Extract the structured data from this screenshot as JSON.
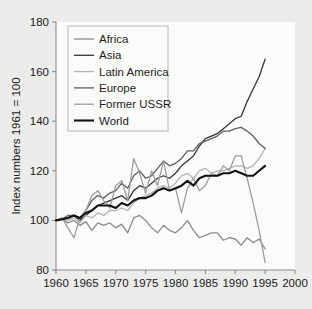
{
  "figure": {
    "background_color": "#ececeb",
    "plot_background_color": "#fbfbfa",
    "frame_color": "#8d8d8d"
  },
  "axes": {
    "y_title": "Index numbers 1961 = 100",
    "y_ticks": [
      "80",
      "100",
      "120",
      "140",
      "160",
      "180"
    ],
    "x_ticks": [
      "1960",
      "1965",
      "1970",
      "1975",
      "1980",
      "1985",
      "1990",
      "1995",
      "2000"
    ]
  },
  "legend": {
    "entries": [
      {
        "label": "Africa",
        "color": "#8c8c8c",
        "width": 1.3
      },
      {
        "label": "Asia",
        "color": "#353535",
        "width": 1.3
      },
      {
        "label": "Latin America",
        "color": "#b4b4b4",
        "width": 1.3
      },
      {
        "label": "Europe",
        "color": "#5f5f5f",
        "width": 1.3
      },
      {
        "label": "Former USSR",
        "color": "#9d9d9d",
        "width": 1.3
      },
      {
        "label": "World",
        "color": "#111111",
        "width": 2.1
      }
    ]
  },
  "chart_data": {
    "type": "line",
    "title": "",
    "xlabel": "",
    "ylabel": "Index numbers 1961 = 100",
    "xlim": [
      1960,
      2000
    ],
    "ylim": [
      80,
      180
    ],
    "xticks": [
      1960,
      1965,
      1970,
      1975,
      1980,
      1985,
      1990,
      1995,
      2000
    ],
    "yticks": [
      80,
      100,
      120,
      140,
      160,
      180
    ],
    "grid": false,
    "legend_position": "upper-left-inside",
    "x": [
      1960,
      1961,
      1962,
      1963,
      1964,
      1965,
      1966,
      1967,
      1968,
      1969,
      1970,
      1971,
      1972,
      1973,
      1974,
      1975,
      1976,
      1977,
      1978,
      1979,
      1980,
      1981,
      1982,
      1983,
      1984,
      1985,
      1986,
      1987,
      1988,
      1989,
      1990,
      1991,
      1992,
      1993,
      1994,
      1995
    ],
    "series": [
      {
        "name": "Africa",
        "color": "#8c8c8c",
        "values": [
          100,
          100.5,
          99,
          100,
          98,
          99.5,
          96,
          99,
          98,
          99,
          97,
          98.5,
          95,
          101,
          102,
          100,
          97,
          95,
          98,
          96,
          95,
          97,
          100,
          96,
          93,
          94,
          95,
          95,
          92,
          93,
          92.5,
          90,
          93,
          91,
          92.5,
          88.5
        ]
      },
      {
        "name": "Asia",
        "color": "#353535",
        "values": [
          100,
          100.5,
          101,
          102,
          100,
          102,
          104,
          106,
          107,
          108,
          109,
          110,
          108,
          112,
          114,
          113,
          115,
          117,
          118,
          117,
          119,
          122,
          124,
          126,
          130,
          133,
          134,
          135,
          137,
          139,
          141,
          142,
          148,
          153,
          158,
          165
        ]
      },
      {
        "name": "Latin America",
        "color": "#b4b4b4",
        "values": [
          100,
          100.3,
          100,
          101,
          99,
          102,
          101,
          103,
          102,
          104,
          104,
          105,
          104,
          107,
          109,
          110,
          111,
          113,
          114,
          113,
          115,
          118,
          119,
          117,
          120,
          121,
          119,
          120,
          120,
          121,
          122,
          122,
          121,
          122,
          125,
          129
        ]
      },
      {
        "name": "Europe",
        "color": "#5f5f5f",
        "values": [
          100,
          100.5,
          102,
          102,
          101,
          104,
          108,
          110,
          109,
          111,
          112,
          115,
          113,
          118,
          120,
          117,
          118,
          121,
          124,
          122,
          123,
          125,
          128,
          128,
          131,
          132,
          133,
          134,
          136,
          136,
          137,
          137.5,
          136,
          134,
          131,
          129
        ]
      },
      {
        "name": "Former USSR",
        "color": "#9d9d9d",
        "values": [
          100,
          101,
          97,
          93,
          101,
          104,
          110,
          112,
          108,
          105,
          114,
          116,
          108,
          125,
          119,
          111,
          120,
          114,
          124,
          112,
          113,
          103,
          113,
          117,
          112,
          114,
          119,
          118,
          122,
          120,
          126,
          126,
          117,
          107,
          96,
          83
        ]
      },
      {
        "name": "World",
        "color": "#111111",
        "values": [
          100,
          100.5,
          101,
          102,
          101,
          103,
          104,
          106,
          106,
          106,
          105,
          107,
          106,
          108,
          109,
          109,
          110,
          112,
          113,
          112,
          113,
          114,
          116,
          114,
          117,
          118,
          118,
          118,
          119,
          119,
          120,
          119,
          118,
          118,
          120,
          122
        ]
      }
    ]
  }
}
